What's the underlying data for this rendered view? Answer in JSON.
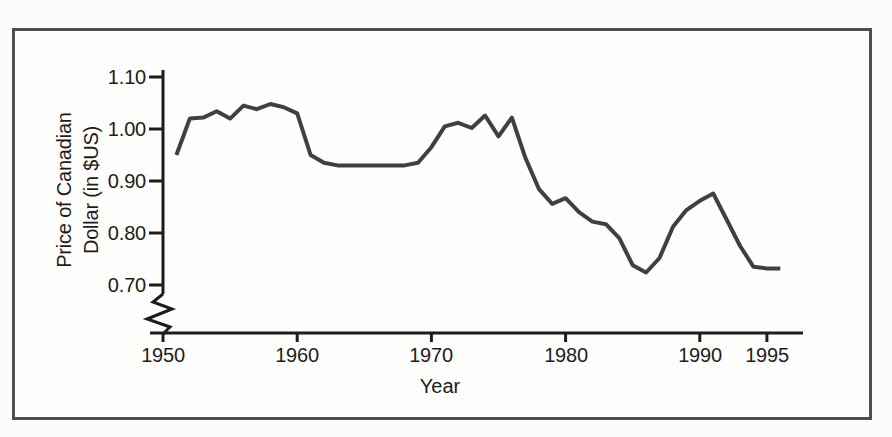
{
  "figure": {
    "xlabel": "Year",
    "ylabel_line1": "Price of Canadian",
    "ylabel_line2": "Dollar (in $US)"
  },
  "chart_data": {
    "type": "line",
    "title": "",
    "xlabel": "Year",
    "ylabel": "Price of Canadian Dollar (in $US)",
    "ylabel_lines": [
      "Price of Canadian",
      "Dollar (in $US)"
    ],
    "x_ticks": [
      1950,
      1960,
      1970,
      1980,
      1990,
      1995
    ],
    "x_tick_labels": [
      "1950",
      "1960",
      "1970",
      "1980",
      "1990",
      "1995"
    ],
    "y_ticks": [
      1.1,
      1.0,
      0.9,
      0.8,
      0.7
    ],
    "y_tick_labels": [
      "1.10",
      "1.00",
      "0.90",
      "0.80",
      "0.70"
    ],
    "xlim": [
      1950,
      1997.7
    ],
    "ylim": [
      0.7,
      1.1
    ],
    "y_axis_break_below": 0.7,
    "grid": false,
    "legend": "none",
    "series": [
      {
        "name": "Price of Canadian Dollar (in $US)",
        "x": [
          1951,
          1952,
          1953,
          1954,
          1955,
          1956,
          1957,
          1958,
          1959,
          1960,
          1961,
          1962,
          1963,
          1964,
          1965,
          1966,
          1967,
          1968,
          1969,
          1970,
          1971,
          1972,
          1973,
          1974,
          1975,
          1976,
          1977,
          1978,
          1979,
          1980,
          1981,
          1982,
          1983,
          1984,
          1985,
          1986,
          1987,
          1988,
          1989,
          1990,
          1991,
          1992,
          1993,
          1994,
          1995,
          1996
        ],
        "y": [
          0.95,
          1.02,
          1.022,
          1.034,
          1.02,
          1.045,
          1.038,
          1.048,
          1.042,
          1.03,
          0.95,
          0.935,
          0.93,
          0.93,
          0.93,
          0.93,
          0.93,
          0.93,
          0.935,
          0.965,
          1.005,
          1.012,
          1.002,
          1.026,
          0.986,
          1.022,
          0.945,
          0.885,
          0.856,
          0.867,
          0.84,
          0.822,
          0.817,
          0.79,
          0.738,
          0.724,
          0.752,
          0.812,
          0.844,
          0.862,
          0.876,
          0.826,
          0.775,
          0.735,
          0.732,
          0.732
        ]
      }
    ],
    "line_color": "#404040",
    "axis_color": "#1d1d1d"
  }
}
